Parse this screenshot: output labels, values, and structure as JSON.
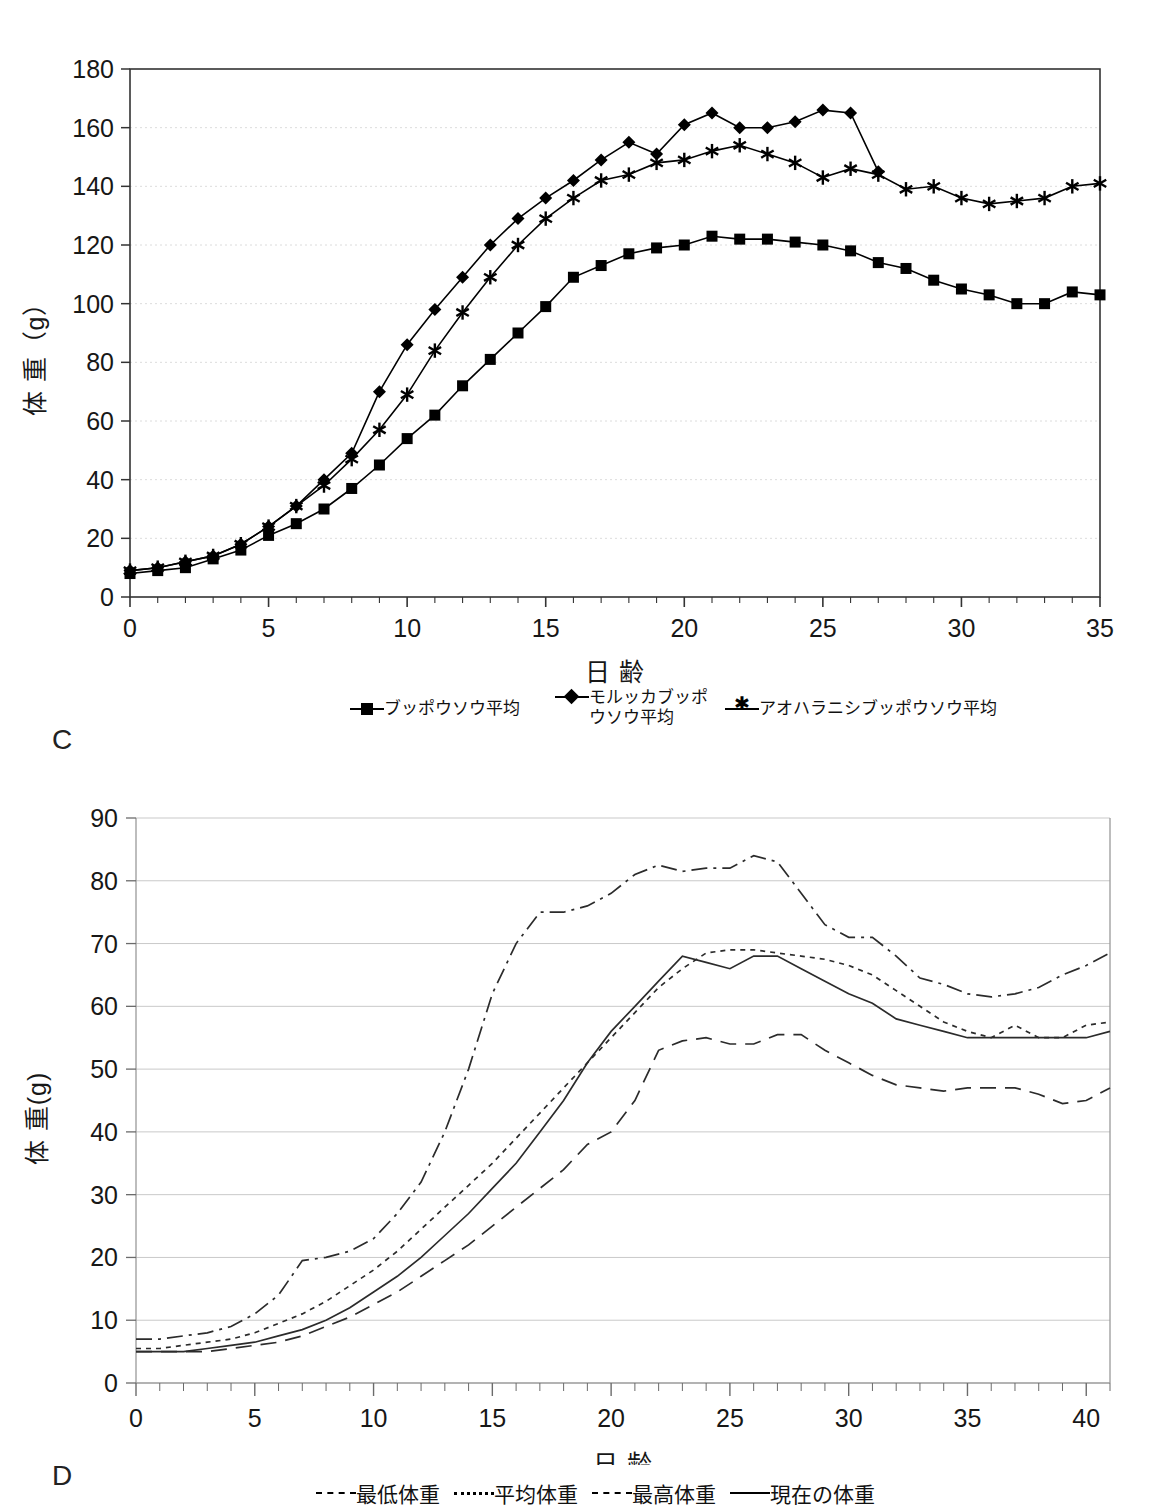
{
  "panels": {
    "c": {
      "letter": "C"
    },
    "d": {
      "letter": "D"
    }
  },
  "chart_data": [
    {
      "id": "chart-c",
      "type": "line",
      "title": "",
      "xlabel": "日  齢",
      "ylabel": "体 重（g）",
      "xlim": [
        0,
        35
      ],
      "ylim": [
        0,
        180
      ],
      "xticks": [
        "0",
        "5",
        "10",
        "15",
        "20",
        "25",
        "30",
        "35"
      ],
      "xtick_values": [
        0,
        5,
        10,
        15,
        20,
        25,
        30,
        35
      ],
      "yticks": [
        "0",
        "20",
        "40",
        "60",
        "80",
        "100",
        "120",
        "140",
        "160",
        "180"
      ],
      "ytick_values": [
        0,
        20,
        40,
        60,
        80,
        100,
        120,
        140,
        160,
        180
      ],
      "grid": true,
      "legend_position": "bottom",
      "x": [
        0,
        1,
        2,
        3,
        4,
        5,
        6,
        7,
        8,
        9,
        10,
        11,
        12,
        13,
        14,
        15,
        16,
        17,
        18,
        19,
        20,
        21,
        22,
        23,
        24,
        25,
        26,
        27,
        28,
        29,
        30,
        31,
        32,
        33,
        34,
        35
      ],
      "series": [
        {
          "name": "ブッポウソウ平均",
          "marker": "square",
          "values": [
            8,
            9,
            10,
            13,
            16,
            21,
            25,
            30,
            37,
            45,
            54,
            62,
            72,
            81,
            90,
            99,
            109,
            113,
            117,
            119,
            120,
            123,
            122,
            122,
            121,
            120,
            118,
            114,
            112,
            108,
            105,
            103,
            100,
            100,
            104,
            103
          ]
        },
        {
          "name": "モルッカブッポウソウ平均",
          "marker": "diamond",
          "values": [
            9,
            10,
            12,
            14,
            18,
            24,
            31,
            40,
            49,
            70,
            86,
            98,
            109,
            120,
            129,
            136,
            142,
            149,
            155,
            151,
            161,
            165,
            160,
            160,
            162,
            166,
            165,
            145,
            null,
            null,
            null,
            null,
            null,
            null,
            null,
            null
          ]
        },
        {
          "name": "アオハラニシブッポウソウ平均",
          "marker": "asterisk",
          "values": [
            9,
            10,
            12,
            14,
            18,
            24,
            31,
            38,
            47,
            57,
            69,
            84,
            97,
            109,
            120,
            129,
            136,
            142,
            144,
            148,
            149,
            152,
            154,
            151,
            148,
            143,
            146,
            144,
            139,
            140,
            136,
            134,
            135,
            136,
            140,
            141
          ]
        }
      ]
    },
    {
      "id": "chart-d",
      "type": "line",
      "title": "",
      "xlabel": "日  齢",
      "ylabel": "体 重(g)",
      "xlim": [
        0,
        41
      ],
      "ylim": [
        0,
        90
      ],
      "xticks": [
        "0",
        "5",
        "10",
        "15",
        "20",
        "25",
        "30",
        "35",
        "40"
      ],
      "xtick_values": [
        0,
        5,
        10,
        15,
        20,
        25,
        30,
        35,
        40
      ],
      "yticks": [
        "0",
        "10",
        "20",
        "30",
        "40",
        "50",
        "60",
        "70",
        "80",
        "90"
      ],
      "ytick_values": [
        0,
        10,
        20,
        30,
        40,
        50,
        60,
        70,
        80,
        90
      ],
      "grid": true,
      "legend_position": "bottom",
      "x": [
        0,
        1,
        2,
        3,
        4,
        5,
        6,
        7,
        8,
        9,
        10,
        11,
        12,
        13,
        14,
        15,
        16,
        17,
        18,
        19,
        20,
        21,
        22,
        23,
        24,
        25,
        26,
        27,
        28,
        29,
        30,
        31,
        32,
        33,
        34,
        35,
        36,
        37,
        38,
        39,
        40,
        41
      ],
      "series": [
        {
          "name": "最低体重",
          "style": "dashed",
          "values": [
            5,
            5,
            5,
            5,
            5.5,
            6,
            6.5,
            7.5,
            9,
            10.5,
            12.5,
            14.5,
            17,
            19.5,
            22,
            25,
            28,
            31,
            34,
            38,
            40,
            45,
            53,
            54.5,
            55,
            54,
            54,
            55.5,
            55.5,
            53,
            51,
            49,
            47.5,
            47,
            46.5,
            47,
            47,
            47,
            46,
            44.5,
            45,
            47
          ]
        },
        {
          "name": "平均体重",
          "style": "dotted",
          "values": [
            5.5,
            5.5,
            6,
            6.5,
            7,
            8,
            9.5,
            11,
            13,
            15.5,
            18,
            21,
            24.5,
            28,
            31.5,
            35,
            39,
            43,
            47,
            51,
            55,
            59,
            63,
            66,
            68.5,
            69,
            69,
            68.5,
            68,
            67.5,
            66.5,
            65,
            62.5,
            60,
            57.5,
            56,
            55,
            57,
            55,
            55,
            57,
            57.5
          ]
        },
        {
          "name": "最高体重",
          "style": "dashdot",
          "values": [
            7,
            7,
            7.5,
            8,
            9,
            11,
            14,
            19.5,
            20,
            21,
            23,
            27,
            32,
            40,
            50,
            62,
            70,
            75,
            75,
            76,
            78,
            81,
            82.5,
            81.5,
            82,
            82,
            84,
            83,
            78,
            73,
            71,
            71,
            68,
            64.5,
            63.5,
            62,
            61.5,
            62,
            63,
            65,
            66.5,
            68.5
          ]
        },
        {
          "name": "現在の体重",
          "style": "solid",
          "values": [
            5,
            5,
            5,
            5.5,
            6,
            6.5,
            7.5,
            8.5,
            10,
            12,
            14.5,
            17,
            20,
            23.5,
            27,
            31,
            35,
            40,
            45,
            51,
            56,
            60,
            64,
            68,
            67,
            66,
            68,
            68,
            66,
            64,
            62,
            60.5,
            58,
            57,
            56,
            55,
            55,
            55,
            55,
            55,
            55,
            56
          ]
        }
      ]
    }
  ]
}
